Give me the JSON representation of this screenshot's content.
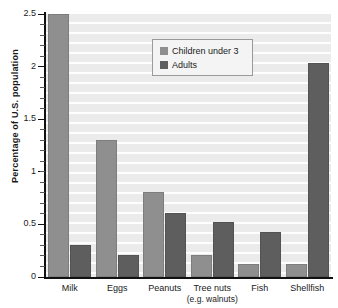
{
  "chart_data": {
    "type": "bar",
    "title": "",
    "xlabel": "",
    "ylabel": "Percentage of U.S. population",
    "ylim": [
      0,
      2.5
    ],
    "yticks": [
      0,
      0.5,
      1,
      1.5,
      2,
      2.5
    ],
    "ytick_labels": [
      "0",
      "0.5",
      "1",
      "1.5",
      "2",
      "2.5"
    ],
    "minor_ticks": true,
    "grid": true,
    "grid_orientation": "horizontal",
    "legend_position": "upper-center",
    "categories": [
      "Milk",
      "Eggs",
      "Peanuts",
      "Tree nuts",
      "Fish",
      "Shellfish"
    ],
    "category_sublabels": [
      "",
      "",
      "",
      "(e.g. walnuts)",
      "",
      ""
    ],
    "series": [
      {
        "name": "Children under 3",
        "color": "#8f8f8f",
        "values": [
          2.5,
          1.3,
          0.81,
          0.21,
          0.12,
          0.12
        ]
      },
      {
        "name": "Adults",
        "color": "#5e5e5e",
        "values": [
          0.3,
          0.21,
          0.61,
          0.52,
          0.43,
          2.03
        ]
      }
    ]
  },
  "legend": {
    "entries": [
      {
        "label": "Children under 3"
      },
      {
        "label": "Adults"
      }
    ]
  },
  "axis": {
    "y_title": "Percentage of U.S. population"
  },
  "colors": {
    "plot_background": "#ebebeb",
    "gridline": "#ffffff",
    "axis": "#111111",
    "series_children": "#8f8f8f",
    "series_adults": "#5e5e5e",
    "legend_background": "#f4f4f4",
    "legend_border": "#9a9a9a"
  }
}
